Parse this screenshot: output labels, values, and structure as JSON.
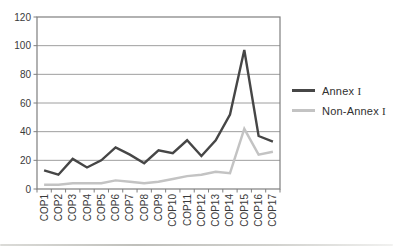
{
  "figure": {
    "background": "#ffffff",
    "page_edge_color": "#b4b4ae"
  },
  "chart_data": {
    "type": "line",
    "title": "",
    "xlabel": "",
    "ylabel": "",
    "categories": [
      "COP1",
      "COP2",
      "COP3",
      "COP4",
      "COP5",
      "COP6",
      "COP7",
      "COP8",
      "COP9",
      "COP10",
      "COP11",
      "COP12",
      "COP13",
      "COP14",
      "COP15",
      "COP16",
      "COP17"
    ],
    "series": [
      {
        "name": "Annex I",
        "color": "#464646",
        "stroke_width": 2.4,
        "values": [
          13,
          10,
          21,
          15,
          20,
          29,
          24,
          18,
          27,
          25,
          34,
          23,
          34,
          52,
          97,
          37,
          33
        ]
      },
      {
        "name": "Non-Annex I",
        "color": "#c3c3c3",
        "stroke_width": 2.4,
        "values": [
          3,
          3,
          4,
          4,
          4,
          6,
          5,
          4,
          5,
          7,
          9,
          10,
          12,
          11,
          42,
          24,
          26
        ]
      }
    ],
    "ylim": [
      0,
      120
    ],
    "yticks": [
      0,
      20,
      40,
      60,
      80,
      100,
      120
    ],
    "grid": "horizontal",
    "legend_position": "right",
    "x_tick_label_rotation": -90
  },
  "styles": {
    "grid_color": "#9e9e9e",
    "axis_color": "#7f7f7f",
    "tick_color": "#7f7f7f",
    "label_color": "#3a3a3a"
  }
}
